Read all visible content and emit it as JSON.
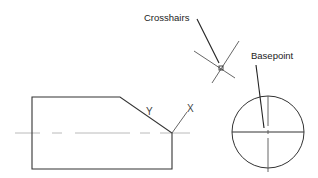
{
  "diagram": {
    "labels": {
      "crosshairs": "Crosshairs",
      "basepoint": "Basepoint",
      "axis_x": "X",
      "axis_y": "Y"
    },
    "colors": {
      "stroke": "#333333",
      "centerline": "#999999",
      "background": "#ffffff"
    }
  }
}
